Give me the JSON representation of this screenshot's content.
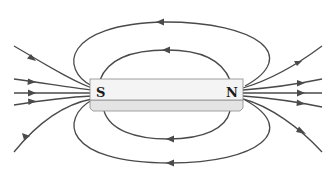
{
  "diagram": {
    "magnet": {
      "south_label": "S",
      "north_label": "N"
    },
    "colors": {
      "field_line": "#4a4a4a",
      "magnet_face": "#f4f4f4",
      "magnet_edge": "#8a8a8a"
    },
    "field_lines": [
      {
        "id": "top-outer-loop",
        "direction": "N to S (arrow pointing left)"
      },
      {
        "id": "top-inner-loop",
        "direction": "N to S (arrow pointing left)"
      },
      {
        "id": "bottom-inner-loop",
        "direction": "N to S (arrow pointing left)"
      },
      {
        "id": "bottom-outer-loop",
        "direction": "N to S (arrow pointing left)"
      },
      {
        "id": "left-open-lines",
        "count": 5,
        "direction": "into S pole"
      },
      {
        "id": "right-open-lines",
        "count": 5,
        "direction": "out of N pole"
      }
    ]
  }
}
